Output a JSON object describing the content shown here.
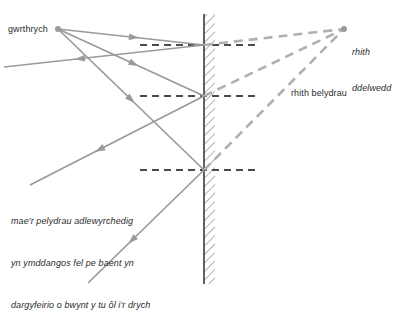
{
  "diagram": {
    "language": "cy",
    "labels": {
      "object": "gwrthrych",
      "virtual_image_line1": "rhith",
      "virtual_image_line2": "ddelwedd",
      "virtual_rays": "rhith belydrau",
      "note_line1": "mae'r pelydrau adlewyrchedig",
      "note_line2": "yn ymddangos fel pe baent yn",
      "note_line3": "dargyfeirio o bwynt y tu ôl i'r drych"
    },
    "colors": {
      "ray": "#9a9a9a",
      "virtual_ray": "#b0b0b0",
      "normal": "#111111",
      "mirror_line": "#3a3a3a",
      "mirror_hatch": "#9e9e9e",
      "point": "#9a9a9a",
      "text": "#2b2b2b",
      "background": "#ffffff"
    },
    "points": {
      "object": {
        "x": 58,
        "y": 29,
        "r": 3
      },
      "virtual_image": {
        "x": 344,
        "y": 29,
        "r": 3
      }
    },
    "mirror": {
      "surface_x": 204,
      "hatch_width": 11,
      "top_y": 14,
      "bottom_y": 284
    },
    "reflection_points": [
      {
        "x": 204,
        "y": 45
      },
      {
        "x": 204,
        "y": 96
      },
      {
        "x": 204,
        "y": 170
      }
    ],
    "normals": [
      {
        "x1": 140,
        "y1": 45,
        "x2": 258,
        "y2": 45
      },
      {
        "x1": 140,
        "y1": 96,
        "x2": 258,
        "y2": 96
      },
      {
        "x1": 140,
        "y1": 170,
        "x2": 258,
        "y2": 170
      }
    ],
    "incident_rays": [
      {
        "x1": 58,
        "y1": 29,
        "x2": 204,
        "y2": 45,
        "arrow_t": 0.52
      },
      {
        "x1": 58,
        "y1": 29,
        "x2": 204,
        "y2": 96,
        "arrow_t": 0.52
      },
      {
        "x1": 58,
        "y1": 29,
        "x2": 204,
        "y2": 170,
        "arrow_t": 0.5
      }
    ],
    "reflected_rays": [
      {
        "x1": 204,
        "y1": 45,
        "x2": 4,
        "y2": 67,
        "arrow_t": 0.62
      },
      {
        "x1": 204,
        "y1": 96,
        "x2": 30,
        "y2": 185,
        "arrow_t": 0.6
      },
      {
        "x1": 204,
        "y1": 170,
        "x2": 88,
        "y2": 283,
        "arrow_t": 0.62
      }
    ],
    "virtual_rays": [
      {
        "x1": 204,
        "y1": 45,
        "x2": 344,
        "y2": 29
      },
      {
        "x1": 204,
        "y1": 96,
        "x2": 344,
        "y2": 29
      },
      {
        "x1": 204,
        "y1": 170,
        "x2": 344,
        "y2": 29
      }
    ]
  }
}
